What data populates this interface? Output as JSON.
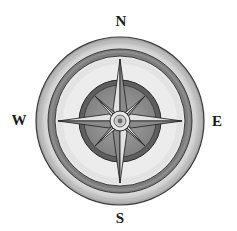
{
  "image": {
    "subject": "compass-rose-illustration",
    "style": "watercolor grayscale"
  },
  "directions": {
    "north": "N",
    "south": "S",
    "east": "E",
    "west": "W"
  },
  "colors": {
    "background": "#ffffff",
    "outer_ring": "#dcdcdc",
    "outer_ring_shade": "#a8a8a8",
    "dark_band": "#7d7d7d",
    "light_field": "#ececec",
    "inner_disc_rim": "#5e5e5e",
    "inner_disc": "#8f8f8f",
    "star_light": "#e6e6e6",
    "star_dark": "#9a9a9a",
    "outline": "#2a2a2a",
    "label": "#1a1a1a"
  }
}
